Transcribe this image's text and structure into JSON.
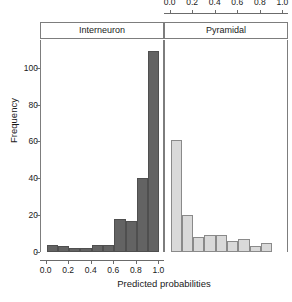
{
  "chart_data": {
    "type": "bar",
    "title": "",
    "subtitle": "",
    "xlabel": "Predicted probabilities",
    "ylabel": "Frequency",
    "ylim": [
      0,
      115
    ],
    "xlim": [
      -0.05,
      1.05
    ],
    "grid": false,
    "legend_position": "none",
    "bin_width": 0.1,
    "panels": [
      {
        "name": "Interneuron",
        "axis_side": "bottom",
        "color": "#636363",
        "bin_edges": [
          0.0,
          0.1,
          0.2,
          0.3,
          0.4,
          0.5,
          0.6,
          0.7,
          0.8,
          0.9,
          1.0
        ],
        "bin_centers": [
          0.05,
          0.15,
          0.25,
          0.35,
          0.45,
          0.55,
          0.65,
          0.75,
          0.85,
          0.95
        ],
        "values": [
          4,
          3,
          2,
          2,
          4,
          4,
          18,
          17,
          40,
          109
        ],
        "tick_labels": [
          "0.0",
          "0.2",
          "0.4",
          "0.6",
          "0.8",
          "1.0"
        ],
        "tick_values": [
          0.0,
          0.2,
          0.4,
          0.6,
          0.8,
          1.0
        ]
      },
      {
        "name": "Pyramidal",
        "axis_side": "top",
        "color": "#d9d9d9",
        "bin_edges": [
          0.0,
          0.1,
          0.2,
          0.3,
          0.4,
          0.5,
          0.6,
          0.7,
          0.8,
          0.9,
          1.0
        ],
        "bin_centers": [
          0.05,
          0.15,
          0.25,
          0.35,
          0.45,
          0.55,
          0.65,
          0.75,
          0.85,
          0.95
        ],
        "values": [
          61,
          20,
          8,
          9,
          9,
          6,
          7,
          3,
          5,
          0
        ],
        "tick_labels": [
          "0.0",
          "0.2",
          "0.4",
          "0.6",
          "0.8",
          "1.0"
        ],
        "tick_values": [
          0.0,
          0.2,
          0.4,
          0.6,
          0.8,
          1.0
        ]
      }
    ],
    "y_ticks": [
      0,
      20,
      40,
      60,
      80,
      100
    ],
    "y_tick_labels": [
      "0",
      "20",
      "40",
      "60",
      "80",
      "100"
    ],
    "colors": {
      "interneuron_fill": "#636363",
      "pyramidal_fill": "#d9d9d9",
      "axis": "#6b6b6b",
      "border": "#7d7d7d",
      "text": "#1a1a1a",
      "background": "#ffffff"
    }
  }
}
